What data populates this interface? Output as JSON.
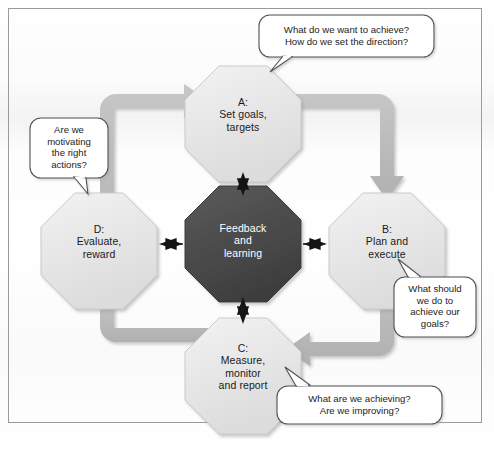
{
  "diagram": {
    "frame": {
      "border_color": "#9a9a9a"
    },
    "colors": {
      "arrow_gray": "#b9b9b9",
      "node_light": "#e8e8e8",
      "node_center_dark": "#4a4a4a",
      "node_stroke": "#c9c9c9",
      "bubble_stroke": "#5a5a5a",
      "connector_black": "#1a1a1a",
      "text_dark": "#1a1a1a",
      "text_light": "#ffffff"
    },
    "nodes": [
      {
        "id": "A",
        "data_name": "node-a-set-goals",
        "lines": [
          "A:",
          "Set goals,",
          "targets"
        ],
        "style": "light"
      },
      {
        "id": "B",
        "data_name": "node-b-plan-execute",
        "lines": [
          "B:",
          "Plan and",
          "execute"
        ],
        "style": "light"
      },
      {
        "id": "C",
        "data_name": "node-c-measure-monitor",
        "lines": [
          "C:",
          "Measure,",
          "monitor",
          "and report"
        ],
        "style": "light"
      },
      {
        "id": "D",
        "data_name": "node-d-evaluate-reward",
        "lines": [
          "D:",
          "Evaluate,",
          "reward"
        ],
        "style": "light"
      },
      {
        "id": "center",
        "data_name": "node-center-feedback-learning",
        "lines": [
          "Feedback",
          "and",
          "learning"
        ],
        "style": "dark"
      }
    ],
    "callouts": [
      {
        "id": "top",
        "data_name": "callout-set-goals",
        "anchor": "A",
        "lines": [
          "What do we want to achieve?",
          "How do we set the direction?"
        ]
      },
      {
        "id": "right",
        "data_name": "callout-plan-execute",
        "anchor": "B",
        "lines": [
          "What should",
          "we do to",
          "achieve our",
          "goals?"
        ]
      },
      {
        "id": "bottom",
        "data_name": "callout-measure-monitor",
        "anchor": "C",
        "lines": [
          "What are we achieving?",
          "Are we improving?"
        ]
      },
      {
        "id": "left",
        "data_name": "callout-evaluate-reward",
        "anchor": "D",
        "lines": [
          "Are we",
          "motivating",
          "the right",
          "actions?"
        ]
      }
    ],
    "flow": {
      "direction": "clockwise",
      "sequence": [
        "D",
        "A",
        "B",
        "C"
      ],
      "hub_connections": [
        "A",
        "B",
        "C",
        "D"
      ],
      "hub_arrow_type": "double-headed"
    }
  }
}
